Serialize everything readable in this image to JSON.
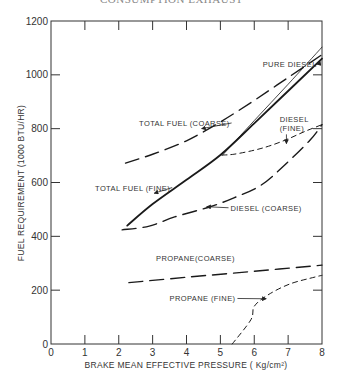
{
  "header": {
    "cutoff_title": "CONSUMPTION EXHAUST"
  },
  "chart_data": {
    "type": "line",
    "title": "",
    "xlabel": "BRAKE MEAN EFFECTIVE PRESSURE ( Kg/cm²)",
    "ylabel": "FUEL REQUIREMENT (1000 BTU/HR)",
    "xlim": [
      0,
      8
    ],
    "ylim": [
      0,
      1200
    ],
    "xticks": [
      0,
      1,
      2,
      3,
      4,
      5,
      6,
      7,
      8
    ],
    "yticks": [
      0,
      200,
      400,
      600,
      800,
      1000,
      1200
    ],
    "grid": false,
    "legend": "annotations",
    "series": [
      {
        "name": "PURE DIESEL",
        "style": "solid-thin",
        "x": [
          5.05,
          6.0,
          7.0,
          8.0
        ],
        "y": [
          700,
          830,
          965,
          1103
        ]
      },
      {
        "name": "TOTAL FUEL (COARSE)",
        "style": "longdash",
        "x": [
          2.2,
          3.0,
          4.0,
          5.0,
          6.0,
          7.0,
          8.0
        ],
        "y": [
          672,
          705,
          755,
          825,
          905,
          990,
          1075
        ]
      },
      {
        "name": "TOTAL FUEL (FINE)",
        "style": "solid-thick",
        "x": [
          2.25,
          3.0,
          4.0,
          5.0,
          6.0,
          7.0,
          8.0
        ],
        "y": [
          440,
          520,
          610,
          702,
          820,
          940,
          1060
        ]
      },
      {
        "name": "DIESEL (FINE)",
        "style": "shortdash",
        "x": [
          5.05,
          5.4,
          6.0,
          6.5,
          7.0,
          7.5,
          8.0
        ],
        "y": [
          702,
          705,
          720,
          738,
          762,
          790,
          815
        ]
      },
      {
        "name": "DIESEL (COARSE)",
        "style": "longdash",
        "x": [
          2.1,
          2.9,
          3.65,
          4.7,
          5.4,
          6.2,
          6.9,
          7.65,
          8.0
        ],
        "y": [
          424,
          438,
          472,
          510,
          543,
          590,
          665,
          758,
          815
        ]
      },
      {
        "name": "PROPANE (COARSE)",
        "style": "longdash",
        "x": [
          2.3,
          4.0,
          6.0,
          8.0
        ],
        "y": [
          228,
          248,
          270,
          293
        ]
      },
      {
        "name": "PROPANE (FINE)",
        "style": "shortdash",
        "x": [
          5.35,
          5.9,
          6.0,
          6.4,
          7.05,
          7.8,
          8.0
        ],
        "y": [
          0,
          90,
          140,
          182,
          223,
          249,
          255
        ]
      }
    ],
    "annotations": [
      {
        "text": "PURE DIESEL",
        "x": 6.25,
        "y": 1030,
        "arrow_to": [
          7.85,
          1040
        ]
      },
      {
        "text": "TOTAL FUEL (COARSE)",
        "x": 2.6,
        "y": 810,
        "arrow_to": [
          4.45,
          800
        ]
      },
      {
        "text": "DIESEL",
        "x": 6.75,
        "y": 825
      },
      {
        "text": "(FINE)",
        "x": 6.75,
        "y": 790,
        "arrow_to": [
          6.95,
          745
        ]
      },
      {
        "text": "TOTAL FUEL (FINE)",
        "x": 1.3,
        "y": 570,
        "arrow_to": [
          3.05,
          560
        ]
      },
      {
        "text": "DIESEL (COARSE)",
        "x": 5.3,
        "y": 495,
        "arrow_to": [
          4.6,
          510
        ]
      },
      {
        "text": "PROPANE(COARSE)",
        "x": 3.1,
        "y": 310
      },
      {
        "text": "PROPANE (FINE)",
        "x": 3.5,
        "y": 158,
        "arrow_to": [
          6.35,
          168
        ]
      }
    ]
  }
}
